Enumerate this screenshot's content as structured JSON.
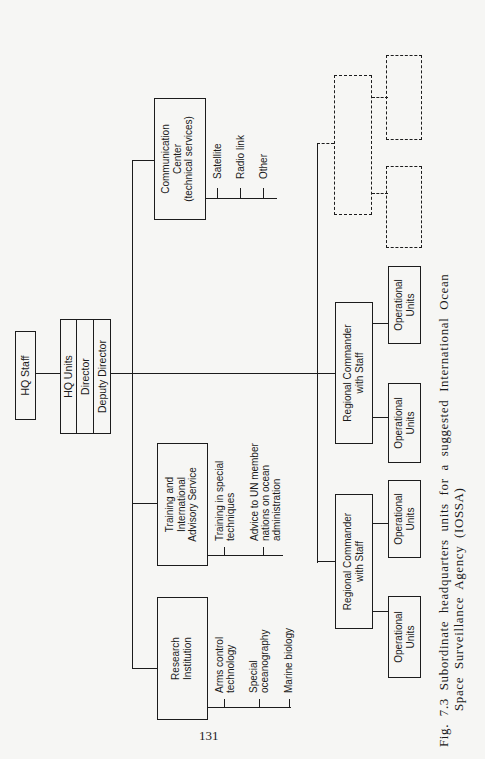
{
  "figure": {
    "caption_line1": "Fig. 7.3  Subordinate headquarters units for a suggested International Ocean",
    "caption_line2": "Space Surveillance Agency (IOSSA)",
    "page_number": "131"
  },
  "hq": {
    "staff": "HQ Staff",
    "units": "HQ Units",
    "director": "Director",
    "deputy_director": "Deputy Director"
  },
  "branches": {
    "communication": {
      "title_lines": [
        "Communication",
        "Center",
        "(technical services)"
      ],
      "items": [
        "Satellite",
        "Radio link",
        "Other"
      ]
    },
    "training": {
      "title_lines": [
        "Training and",
        "International",
        "Advisory Service"
      ],
      "items": [
        [
          "Training in special",
          "techniques"
        ],
        [
          "Advice to UN member",
          "nations on ocean",
          "administration"
        ]
      ]
    },
    "research": {
      "title_lines": [
        "Research",
        "Institution"
      ],
      "items": [
        [
          "Arms control",
          "technology"
        ],
        [
          "Special",
          "oceanography"
        ],
        [
          "Marine biology"
        ]
      ]
    }
  },
  "regional": [
    {
      "title_lines": [
        "Regional Commander",
        "with Staff"
      ],
      "units": [
        [
          "Operational",
          "Units"
        ],
        [
          "Operational",
          "Units"
        ]
      ]
    },
    {
      "title_lines": [
        "Regional Commander",
        "with Staff"
      ],
      "units": [
        [
          "Operational",
          "Units"
        ],
        [
          "Operational",
          "Units"
        ]
      ]
    }
  ],
  "placeholder_boxes_count": 3
}
